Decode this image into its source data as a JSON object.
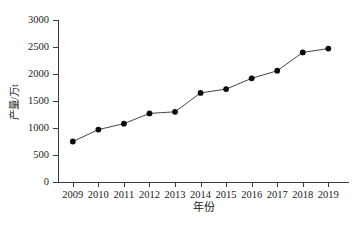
{
  "chart_data": {
    "type": "line",
    "title": "",
    "subtitle": "",
    "xlabel": "年份",
    "ylabel": "产量/万t",
    "categories": [
      "2009",
      "2010",
      "2011",
      "2012",
      "2013",
      "2014",
      "2015",
      "2016",
      "2017",
      "2018",
      "2019"
    ],
    "x": [
      2009,
      2010,
      2011,
      2012,
      2013,
      2014,
      2015,
      2016,
      2017,
      2018,
      2019
    ],
    "values": [
      750,
      970,
      1080,
      1270,
      1300,
      1650,
      1720,
      1920,
      2060,
      2400,
      2470
    ],
    "series": [
      {
        "name": "产量",
        "values": [
          750,
          970,
          1080,
          1270,
          1300,
          1650,
          1720,
          1920,
          2060,
          2400,
          2470
        ],
        "marker": "filled-circle",
        "marker_color": "#0a0a0a",
        "line_color": "#303030"
      }
    ],
    "ylim": [
      0,
      3000
    ],
    "yticks": [
      0,
      500,
      1000,
      1500,
      2000,
      2500,
      3000
    ],
    "ytick_labels": [
      "0",
      "500",
      "1000",
      "1500",
      "2000",
      "2500",
      "3000"
    ],
    "xtick_labels": [
      "2009",
      "2010",
      "2011",
      "2012",
      "2013",
      "2014",
      "2015",
      "2016",
      "2017",
      "2018",
      "2019"
    ],
    "grid": false,
    "legend": false,
    "legend_position": "none",
    "annotations": []
  },
  "axis": {
    "y_title": "产量/万t",
    "x_title": "年份",
    "spine_color": "#3c3c3c"
  },
  "colors": {
    "background": "#ffffff",
    "marker": "#0a0a0a",
    "line": "#303030",
    "axis": "#3c3c3c",
    "text": "#1a1a1a"
  }
}
